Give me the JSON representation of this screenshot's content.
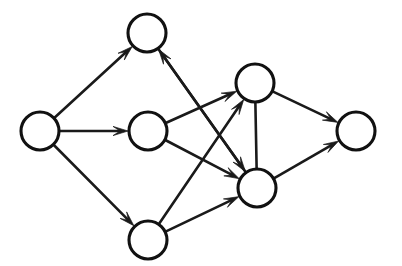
{
  "diagram": {
    "type": "directed-graph",
    "canvas": {
      "width": 402,
      "height": 266,
      "background": "#ffffff"
    },
    "style": {
      "node_fill": "#ffffff",
      "node_stroke": "#111111",
      "node_stroke_width": 3.1,
      "node_radius": 19,
      "edge_stroke": "#1a1a1a",
      "edge_stroke_width": 2.6,
      "arrowhead_length": 15,
      "arrowhead_half_width": 4.6
    },
    "nodes": [
      {
        "id": "input",
        "label": "",
        "role": "source",
        "cx": 40,
        "cy": 131,
        "r": 19
      },
      {
        "id": "top",
        "label": "",
        "role": "hidden",
        "cx": 147,
        "cy": 33,
        "r": 19
      },
      {
        "id": "middle",
        "label": "",
        "role": "hidden",
        "cx": 148,
        "cy": 131,
        "r": 19
      },
      {
        "id": "bottom",
        "label": "",
        "role": "hidden",
        "cx": 148,
        "cy": 240,
        "r": 19
      },
      {
        "id": "upper-right",
        "label": "",
        "role": "hidden",
        "cx": 255,
        "cy": 83,
        "r": 19
      },
      {
        "id": "lower-right",
        "label": "",
        "role": "hidden",
        "cx": 257,
        "cy": 188,
        "r": 19
      },
      {
        "id": "output",
        "label": "",
        "role": "sink",
        "cx": 356,
        "cy": 131,
        "r": 19
      }
    ],
    "edges": [
      {
        "id": "e1",
        "from": "input",
        "to": "top",
        "directed": true,
        "arrow_at": "target"
      },
      {
        "id": "e2",
        "from": "input",
        "to": "middle",
        "directed": true,
        "arrow_at": "target"
      },
      {
        "id": "e3",
        "from": "input",
        "to": "bottom",
        "directed": true,
        "arrow_at": "target"
      },
      {
        "id": "e4",
        "from": "top",
        "to": "lower-right",
        "directed": true,
        "arrow_at": "target"
      },
      {
        "id": "e5",
        "from": "lower-right",
        "to": "top",
        "directed": true,
        "arrow_at": "target"
      },
      {
        "id": "e6",
        "from": "middle",
        "to": "upper-right",
        "directed": true,
        "arrow_at": "target"
      },
      {
        "id": "e7",
        "from": "middle",
        "to": "lower-right",
        "directed": true,
        "arrow_at": "target"
      },
      {
        "id": "e8",
        "from": "bottom",
        "to": "upper-right",
        "directed": true,
        "arrow_at": "target"
      },
      {
        "id": "e9",
        "from": "bottom",
        "to": "lower-right",
        "directed": true,
        "arrow_at": "target"
      },
      {
        "id": "e10",
        "from": "upper-right",
        "to": "lower-right",
        "directed": false,
        "arrow_at": "none"
      },
      {
        "id": "e11",
        "from": "upper-right",
        "to": "output",
        "directed": true,
        "arrow_at": "target"
      },
      {
        "id": "e12",
        "from": "lower-right",
        "to": "output",
        "directed": true,
        "arrow_at": "target"
      }
    ],
    "counts": {
      "nodes": 7,
      "edges": 12
    }
  }
}
